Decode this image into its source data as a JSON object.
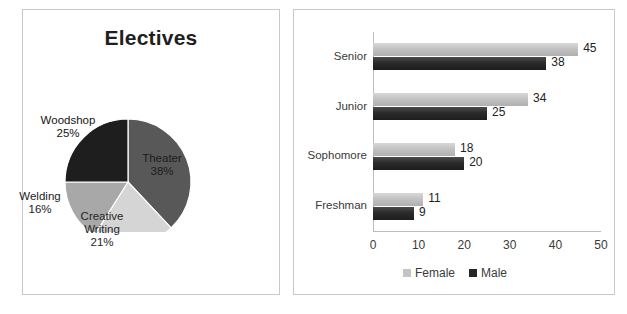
{
  "figure": {
    "background_color": "#ffffff",
    "panel_border_color": "#c9c9c9"
  },
  "pie_panel": {
    "title": "Electives",
    "name": "electives-pie-panel"
  },
  "bar_panel": {
    "name": "class-by-gender-bar-panel"
  },
  "chart_data": [
    {
      "type": "pie",
      "title": "Electives",
      "labels": [
        "Theater",
        "Creative Writing",
        "Welding",
        "Woodshop"
      ],
      "display_labels": [
        "Theater\n38%",
        "Creative\nWriting\n21%",
        "Welding\n16%",
        "Woodshop\n25%"
      ],
      "values": [
        38,
        21,
        16,
        25
      ],
      "value_suffix": "%",
      "colors": [
        "#585858",
        "#d5d5d5",
        "#a8a8a8",
        "#1e1e1e"
      ],
      "start_angle_deg": 0,
      "direction": "clockwise",
      "legend": false,
      "notes": "Fourth slice label is rendered as dark text on a near-black wedge and is largely illegible in the source image; its percentage reads 25%.",
      "slice_label_colors": [
        "#1c1c1c",
        "#262626",
        "#1c1c1c",
        "#141414"
      ]
    },
    {
      "type": "bar",
      "orientation": "horizontal",
      "title": "",
      "xlabel": "",
      "ylabel": "",
      "categories": [
        "Senior",
        "Junior",
        "Sophomore",
        "Freshman"
      ],
      "series": [
        {
          "name": "Female",
          "values": [
            45,
            34,
            18,
            11
          ],
          "color": "#c4c4c4"
        },
        {
          "name": "Male",
          "values": [
            38,
            25,
            20,
            9
          ],
          "color": "#262626"
        }
      ],
      "xlim": [
        0,
        50
      ],
      "xticks": [
        0,
        10,
        20,
        30,
        40,
        50
      ],
      "xtick_labels": [
        "0",
        "10",
        "20",
        "30",
        "40",
        "50"
      ],
      "data_labels": true,
      "grid": false,
      "legend": true,
      "legend_position": "bottom"
    }
  ]
}
